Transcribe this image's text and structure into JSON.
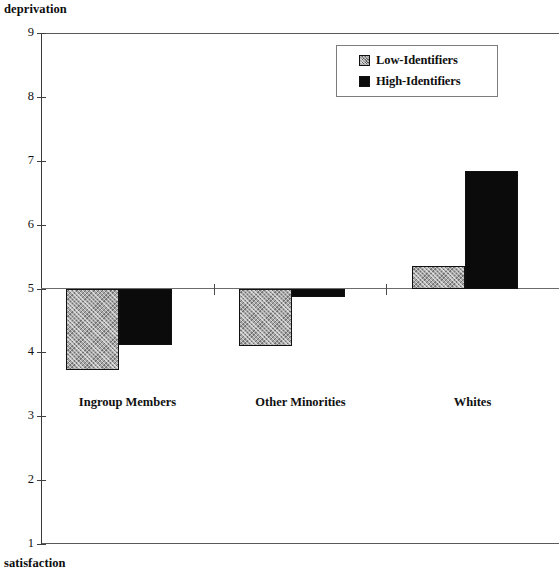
{
  "chart_data": {
    "type": "bar",
    "title": "",
    "top_axis_label": "deprivation",
    "bottom_axis_label": "satisfaction",
    "xlabel": "",
    "ylabel": "",
    "ylim": [
      1,
      9
    ],
    "yticks": [
      9,
      8,
      7,
      6,
      5,
      4,
      3,
      2,
      1
    ],
    "baseline": 5,
    "grid": false,
    "legend_position": "top-right",
    "categories": [
      "Ingroup Members",
      "Other Minorities",
      "Whites"
    ],
    "series": [
      {
        "name": "Low-Identifiers",
        "swatch": "hatched-gray",
        "color": "#a8a8a8",
        "values": [
          3.73,
          4.1,
          5.36
        ]
      },
      {
        "name": "High-Identifiers",
        "swatch": "solid-black",
        "color": "#0b0b0b",
        "values": [
          4.12,
          4.87,
          6.84
        ]
      }
    ]
  },
  "legend": {
    "items": [
      {
        "label": "Low-Identifiers"
      },
      {
        "label": "High-Identifiers"
      }
    ]
  },
  "axis": {
    "top_label": "deprivation",
    "bottom_label": "satisfaction",
    "tick_labels": [
      "9",
      "8",
      "7",
      "6",
      "5",
      "4",
      "3",
      "2",
      "1"
    ]
  }
}
